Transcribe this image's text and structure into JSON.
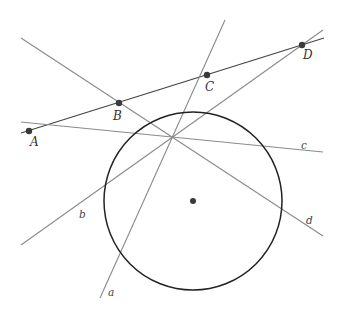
{
  "diagram": {
    "type": "geometry",
    "colors": {
      "line": "#8a8a8a",
      "secant": "#444444",
      "circle": "#222222",
      "point": "#3a3a3a"
    },
    "circle": {
      "center": [
        193,
        201
      ],
      "r": 89
    },
    "concurrency_point": [
      172,
      114
    ],
    "points": [
      {
        "name": "A",
        "x": 29,
        "y": 131
      },
      {
        "name": "B",
        "x": 119,
        "y": 103
      },
      {
        "name": "C",
        "x": 207,
        "y": 75
      },
      {
        "name": "D",
        "x": 302,
        "y": 45
      }
    ],
    "lines": [
      {
        "name": "a",
        "label": "a"
      },
      {
        "name": "b",
        "label": "b"
      },
      {
        "name": "c",
        "label": "c"
      },
      {
        "name": "d",
        "label": "d"
      }
    ],
    "labels": {
      "A": "A",
      "B": "B",
      "C": "C",
      "D": "D",
      "a": "a",
      "b": "b",
      "c": "c",
      "d": "d"
    }
  }
}
